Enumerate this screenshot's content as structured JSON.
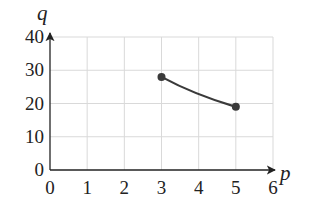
{
  "chart_data": {
    "type": "line",
    "title": "",
    "xlabel": "p",
    "ylabel": "q",
    "xlim": [
      0,
      6
    ],
    "ylim": [
      0,
      40
    ],
    "x_ticks": [
      0,
      1,
      2,
      3,
      4,
      5,
      6
    ],
    "y_ticks": [
      0,
      10,
      20,
      30,
      40
    ],
    "grid": true,
    "legend": null,
    "series": [
      {
        "name": "q(p)",
        "points": [
          [
            3,
            28
          ],
          [
            5,
            19
          ]
        ],
        "endpoints_marked": true,
        "curvature": "slightly convex (decreasing)",
        "color": "#3a3a3a"
      }
    ]
  },
  "colors": {
    "grid": "#d9d9d9",
    "axis": "#222222",
    "curve": "#3a3a3a"
  }
}
